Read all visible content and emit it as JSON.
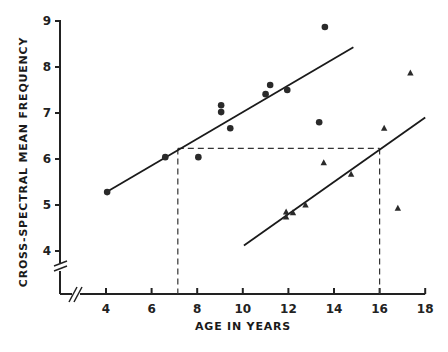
{
  "chart_data": {
    "type": "scatter",
    "title": "",
    "xlabel": "AGE IN YEARS",
    "ylabel": "CROSS-SPECTRAL MEAN FREQUENCY",
    "xlim": [
      3,
      18
    ],
    "ylim": [
      3.4,
      9
    ],
    "x_ticks": [
      4,
      6,
      8,
      10,
      12,
      14,
      16,
      18
    ],
    "y_ticks": [
      4,
      5,
      6,
      7,
      8,
      9
    ],
    "axis_breaks": [
      "x-axis near origin",
      "y-axis near origin"
    ],
    "grid": false,
    "legend": null,
    "series": [
      {
        "name": "circles",
        "marker": "circle",
        "points": [
          {
            "x": 4.05,
            "y": 5.28
          },
          {
            "x": 6.6,
            "y": 6.04
          },
          {
            "x": 8.05,
            "y": 6.04
          },
          {
            "x": 9.05,
            "y": 7.17
          },
          {
            "x": 9.05,
            "y": 7.02
          },
          {
            "x": 9.45,
            "y": 6.67
          },
          {
            "x": 11.0,
            "y": 7.41
          },
          {
            "x": 11.2,
            "y": 7.61
          },
          {
            "x": 11.95,
            "y": 7.5
          },
          {
            "x": 13.35,
            "y": 6.8
          },
          {
            "x": 13.6,
            "y": 8.87
          }
        ],
        "fit_line": {
          "x1": 3.95,
          "y1": 5.26,
          "x2": 14.85,
          "y2": 8.43
        }
      },
      {
        "name": "triangles",
        "marker": "triangle",
        "points": [
          {
            "x": 11.9,
            "y": 4.74
          },
          {
            "x": 11.9,
            "y": 4.85
          },
          {
            "x": 12.2,
            "y": 4.83
          },
          {
            "x": 12.75,
            "y": 5.0
          },
          {
            "x": 13.55,
            "y": 5.92
          },
          {
            "x": 14.75,
            "y": 5.67
          },
          {
            "x": 16.2,
            "y": 6.67
          },
          {
            "x": 16.8,
            "y": 4.93
          },
          {
            "x": 17.35,
            "y": 7.87
          }
        ],
        "fit_line": {
          "x1": 10.05,
          "y1": 4.12,
          "x2": 18.0,
          "y2": 6.9
        }
      }
    ],
    "annotations": {
      "dashed_horizontal_y": 6.23,
      "dashed_vertical_x": [
        7.15,
        16.0
      ]
    }
  }
}
